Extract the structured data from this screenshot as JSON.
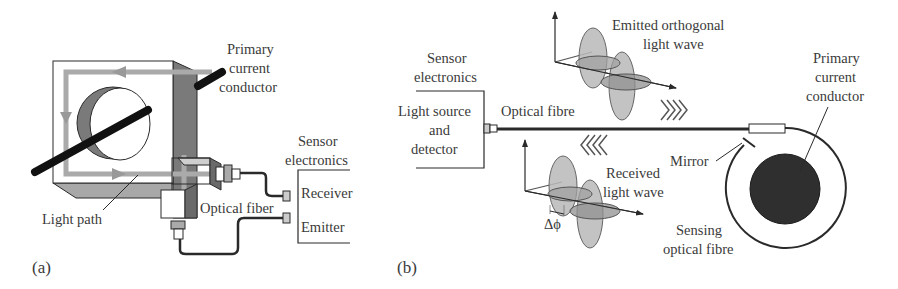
{
  "panel_a": {
    "label": "(a)",
    "primary_conductor": [
      "Primary",
      "current",
      "conductor"
    ],
    "sensor_electronics": [
      "Sensor",
      "electronics"
    ],
    "receiver": "Receiver",
    "emitter": "Emitter",
    "optical_fiber": "Optical fiber",
    "light_path": "Light path"
  },
  "panel_b": {
    "label": "(b)",
    "sensor_electronics": [
      "Sensor",
      "electronics"
    ],
    "light_source": [
      "Light source",
      "and",
      "detector"
    ],
    "optical_fibre": "Optical fibre",
    "emitted_wave": [
      "Emitted orthogonal",
      "light wave"
    ],
    "received_wave": [
      "Received",
      "light wave"
    ],
    "phase_shift": "Δϕ",
    "mirror": "Mirror",
    "primary_conductor": [
      "Primary",
      "current",
      "conductor"
    ],
    "sensing_fibre": [
      "Sensing",
      "optical fibre"
    ]
  },
  "colors": {
    "ink": "#2a2a2a",
    "light_gray": "#b8b8b8",
    "mid_gray": "#8a8a8a",
    "dark_gray": "#6a6a6a",
    "conductor": "#111111"
  }
}
